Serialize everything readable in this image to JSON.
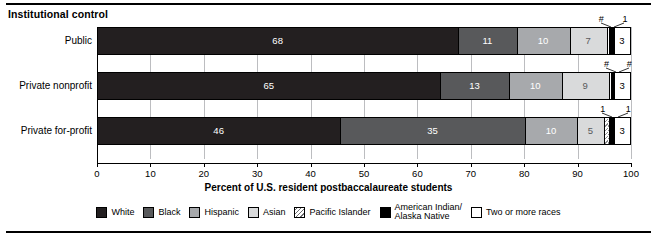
{
  "group_heading": "Institutional control",
  "axis_title": "Percent of U.S. resident postbaccalaureate students",
  "legend": [
    {
      "label": "White",
      "key": "white",
      "color": "#231f20",
      "pattern": "solid"
    },
    {
      "label": "Black",
      "key": "black",
      "color": "#58595b",
      "pattern": "solid"
    },
    {
      "label": "Hispanic",
      "key": "hispanic",
      "color": "#a7a9ac",
      "pattern": "solid"
    },
    {
      "label": "Asian",
      "key": "asian",
      "color": "#d9dadb",
      "pattern": "solid"
    },
    {
      "label": "Pacific Islander",
      "key": "pacific",
      "color": "#ffffff",
      "pattern": "diagonal-hatch"
    },
    {
      "label": "American Indian/\nAlaska Native",
      "key": "amind",
      "color": "#000000",
      "pattern": "solid"
    },
    {
      "label": "Two or more races",
      "key": "two",
      "color": "#ffffff",
      "pattern": "solid"
    }
  ],
  "xaxis": {
    "min": 0,
    "max": 100,
    "ticks": [
      0,
      10,
      20,
      30,
      40,
      50,
      60,
      70,
      80,
      90,
      100
    ],
    "ticklabels": [
      "0",
      "10",
      "20",
      "30",
      "40",
      "50",
      "60",
      "70",
      "80",
      "90",
      "100"
    ]
  },
  "rows": [
    {
      "label": "Public",
      "segments": [
        {
          "key": "white",
          "value": 68,
          "display": "68",
          "inside": true
        },
        {
          "key": "black",
          "value": 11,
          "display": "11",
          "inside": true
        },
        {
          "key": "hispanic",
          "value": 10,
          "display": "10",
          "inside": true
        },
        {
          "key": "asian",
          "value": 7,
          "display": "7",
          "inside": true
        },
        {
          "key": "pacific",
          "value": 0.4,
          "display": "#",
          "inside": false
        },
        {
          "key": "amind",
          "value": 1,
          "display": "1",
          "inside": false
        },
        {
          "key": "two",
          "value": 3,
          "display": "3",
          "inside": true
        }
      ],
      "callouts": [
        "#",
        "1"
      ]
    },
    {
      "label": "Private nonprofit",
      "segments": [
        {
          "key": "white",
          "value": 65,
          "display": "65",
          "inside": true
        },
        {
          "key": "black",
          "value": 13,
          "display": "13",
          "inside": true
        },
        {
          "key": "hispanic",
          "value": 10,
          "display": "10",
          "inside": true
        },
        {
          "key": "asian",
          "value": 9,
          "display": "9",
          "inside": true
        },
        {
          "key": "pacific",
          "value": 0.4,
          "display": "#",
          "inside": false
        },
        {
          "key": "amind",
          "value": 0.6,
          "display": "#",
          "inside": false
        },
        {
          "key": "two",
          "value": 3,
          "display": "3",
          "inside": true
        }
      ],
      "callouts": [
        "#",
        "#"
      ]
    },
    {
      "label": "Private for-profit",
      "segments": [
        {
          "key": "white",
          "value": 46,
          "display": "46",
          "inside": true
        },
        {
          "key": "black",
          "value": 35,
          "display": "35",
          "inside": true
        },
        {
          "key": "hispanic",
          "value": 10,
          "display": "10",
          "inside": true
        },
        {
          "key": "asian",
          "value": 5,
          "display": "5",
          "inside": true
        },
        {
          "key": "pacific",
          "value": 1,
          "display": "1",
          "inside": false
        },
        {
          "key": "amind",
          "value": 1,
          "display": "1",
          "inside": false
        },
        {
          "key": "two",
          "value": 3,
          "display": "3",
          "inside": true
        }
      ],
      "callouts": [
        "1",
        "1"
      ]
    }
  ],
  "chart_data": {
    "type": "bar",
    "orientation": "horizontal",
    "stacked": true,
    "percent": true,
    "title": "Institutional control",
    "xlabel": "Percent of U.S. resident postbaccalaureate students",
    "ylabel": "",
    "xlim": [
      0,
      100
    ],
    "grid": true,
    "legend_position": "bottom",
    "categories": [
      "Public",
      "Private nonprofit",
      "Private for-profit"
    ],
    "series": [
      {
        "name": "White",
        "values": [
          68,
          65,
          46
        ]
      },
      {
        "name": "Black",
        "values": [
          11,
          13,
          35
        ]
      },
      {
        "name": "Hispanic",
        "values": [
          10,
          10,
          10
        ]
      },
      {
        "name": "Asian",
        "values": [
          7,
          9,
          5
        ]
      },
      {
        "name": "Pacific Islander",
        "values": [
          "#",
          "#",
          1
        ]
      },
      {
        "name": "American Indian/Alaska Native",
        "values": [
          1,
          "#",
          1
        ]
      },
      {
        "name": "Two or more races",
        "values": [
          3,
          3,
          3
        ]
      }
    ]
  }
}
